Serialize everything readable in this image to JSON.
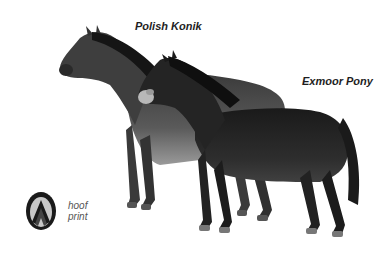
{
  "illustration": {
    "labels": {
      "polish_konik": "Polish Konik",
      "exmoor_pony": "Exmoor Pony",
      "hoof_line1": "hoof",
      "hoof_line2": "print"
    },
    "colors": {
      "background": "#ffffff",
      "konik_body": "#4a4a4a",
      "konik_belly": "#8c8c8c",
      "exmoor_body": "#232323",
      "mane": "#151515",
      "muzzle": "#b8b8b8",
      "text": "#1e1e1e"
    }
  }
}
